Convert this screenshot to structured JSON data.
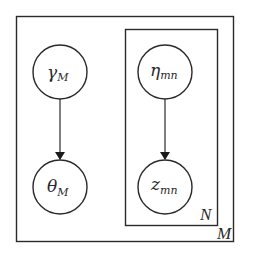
{
  "diagram": {
    "type": "plate-notation graphical model",
    "plates": [
      {
        "id": "outer",
        "label": "M",
        "x": 16,
        "y": 16,
        "width": 217,
        "height": 225
      },
      {
        "id": "inner",
        "label": "N",
        "x": 125,
        "y": 29,
        "width": 92,
        "height": 196
      }
    ],
    "nodes": [
      {
        "id": "gamma",
        "symbol": "γ",
        "subscript": "M",
        "cx": 60,
        "cy": 72,
        "r": 27
      },
      {
        "id": "theta",
        "symbol": "θ",
        "subscript": "M",
        "cx": 60,
        "cy": 187,
        "r": 27
      },
      {
        "id": "eta",
        "symbol": "η",
        "subscript": "mn",
        "cx": 165,
        "cy": 72,
        "r": 27
      },
      {
        "id": "z",
        "symbol": "z",
        "subscript": "mn",
        "cx": 165,
        "cy": 187,
        "r": 27
      }
    ],
    "edges": [
      {
        "from": "gamma",
        "to": "theta"
      },
      {
        "from": "eta",
        "to": "z"
      }
    ],
    "colors": {
      "stroke": "#2a2a2a",
      "background": "#ffffff"
    }
  }
}
